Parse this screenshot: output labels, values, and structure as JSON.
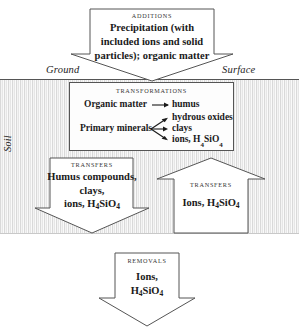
{
  "diagram": {
    "ground_label": "Ground",
    "surface_label": "Surface",
    "soil_label": "Soil",
    "colors": {
      "outline": "#555555",
      "soil_fill": "#f2f2f2",
      "soil_hatch": "#d9d9d9",
      "text": "#1a1a1a"
    }
  },
  "additions": {
    "heading": "ADDITIONS",
    "line1": "Precipitation (with",
    "line2": "included ions and solid",
    "line3": "particles); organic matter",
    "direction": "down"
  },
  "transformations": {
    "heading": "TRANSFORMATIONS",
    "row_organic": "Organic matter",
    "row_organic_product": "humus",
    "row_primary": "Primary minerals",
    "product1": "hydrous oxides",
    "product2": "clays",
    "product3": "ions, H4SiO4",
    "product3_pre": "ions, H",
    "product3_sub1": "4",
    "product3_mid": "SiO",
    "product3_sub2": "4"
  },
  "transfers_left": {
    "heading": "TRANSFERS",
    "line1": "Humus compounds,",
    "line2": "clays,",
    "line3_pre": "ions, H",
    "line3_sub1": "4",
    "line3_mid": "SiO",
    "line3_sub2": "4",
    "direction": "down"
  },
  "transfers_right": {
    "heading": "TRANSFERS",
    "line1_pre": "Ions,  H",
    "line1_sub1": "4",
    "line1_mid": "SiO",
    "line1_sub2": "4",
    "direction": "up"
  },
  "removals": {
    "heading": "REMOVALS",
    "line1": "Ions,",
    "line2_pre": "H",
    "line2_sub1": "4",
    "line2_mid": "SiO",
    "line2_sub2": "4",
    "direction": "down"
  }
}
